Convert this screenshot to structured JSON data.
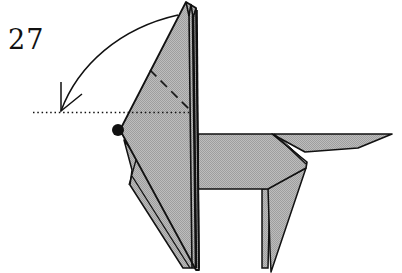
{
  "diagram": {
    "step_number": "27",
    "colors": {
      "paper_fill": "#b3b3b3",
      "outline": "#111111",
      "background": "#ffffff"
    },
    "symbols": [
      {
        "type": "fold-arrow",
        "description": "curved arrow folding head down to dotted line"
      },
      {
        "type": "valley-fold-line",
        "description": "dashed diagonal line on head"
      },
      {
        "type": "reference-line",
        "description": "dotted horizontal line"
      },
      {
        "type": "pivot-point",
        "description": "black dot at nose"
      }
    ]
  }
}
